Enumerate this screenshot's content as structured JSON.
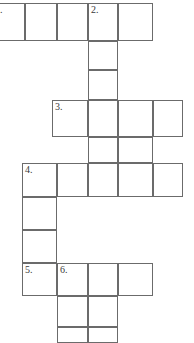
{
  "puzzle": {
    "kind": "crossword-grid",
    "title": "",
    "grid_width_px": 194,
    "grid_height_px": 341,
    "cell_border_color": "#6b6b6b",
    "cell_fill_color": "#ffffff",
    "number_color": "#3a3a3a",
    "column_edges_px": [
      -8,
      25,
      57,
      88,
      118,
      153,
      183
    ],
    "row_edges_px": [
      3,
      41,
      70,
      100,
      137,
      163,
      197,
      230,
      263,
      296,
      327,
      341
    ],
    "clue_numbers_visible": [
      "1.",
      "2.",
      "3.",
      "4.",
      "5.",
      "6."
    ],
    "cells": [
      {
        "name": "r1c1",
        "x": -8,
        "y": 3,
        "w": 33,
        "h": 38,
        "number": "1.",
        "letter": ""
      },
      {
        "name": "r1c2",
        "x": 25,
        "y": 3,
        "w": 32,
        "h": 38,
        "number": "",
        "letter": ""
      },
      {
        "name": "r1c3",
        "x": 57,
        "y": 3,
        "w": 31,
        "h": 38,
        "number": "",
        "letter": ""
      },
      {
        "name": "r1c4",
        "x": 88,
        "y": 3,
        "w": 30,
        "h": 38,
        "number": "2.",
        "letter": ""
      },
      {
        "name": "r1c5",
        "x": 118,
        "y": 3,
        "w": 35,
        "h": 38,
        "number": "",
        "letter": ""
      },
      {
        "name": "r2c4",
        "x": 88,
        "y": 41,
        "w": 30,
        "h": 29,
        "number": "",
        "letter": ""
      },
      {
        "name": "r3c4",
        "x": 88,
        "y": 70,
        "w": 30,
        "h": 30,
        "number": "",
        "letter": ""
      },
      {
        "name": "r4c3",
        "x": 52,
        "y": 100,
        "w": 36,
        "h": 37,
        "number": "3.",
        "letter": ""
      },
      {
        "name": "r4c4",
        "x": 88,
        "y": 100,
        "w": 30,
        "h": 37,
        "number": "",
        "letter": ""
      },
      {
        "name": "r4c5",
        "x": 118,
        "y": 100,
        "w": 35,
        "h": 37,
        "number": "",
        "letter": ""
      },
      {
        "name": "r4c6",
        "x": 153,
        "y": 100,
        "w": 30,
        "h": 37,
        "number": "",
        "letter": ""
      },
      {
        "name": "r5c4",
        "x": 88,
        "y": 137,
        "w": 30,
        "h": 26,
        "number": "",
        "letter": ""
      },
      {
        "name": "r5c5",
        "x": 118,
        "y": 137,
        "w": 35,
        "h": 26,
        "number": "",
        "letter": ""
      },
      {
        "name": "r6c2",
        "x": 22,
        "y": 163,
        "w": 35,
        "h": 34,
        "number": "4.",
        "letter": ""
      },
      {
        "name": "r6c3",
        "x": 57,
        "y": 163,
        "w": 31,
        "h": 34,
        "number": "",
        "letter": ""
      },
      {
        "name": "r6c4",
        "x": 88,
        "y": 163,
        "w": 30,
        "h": 34,
        "number": "",
        "letter": ""
      },
      {
        "name": "r6c5",
        "x": 118,
        "y": 163,
        "w": 35,
        "h": 34,
        "number": "",
        "letter": ""
      },
      {
        "name": "r6c6",
        "x": 153,
        "y": 163,
        "w": 30,
        "h": 34,
        "number": "",
        "letter": ""
      },
      {
        "name": "r7c2",
        "x": 22,
        "y": 197,
        "w": 35,
        "h": 33,
        "number": "",
        "letter": ""
      },
      {
        "name": "r8c2",
        "x": 22,
        "y": 230,
        "w": 35,
        "h": 33,
        "number": "",
        "letter": ""
      },
      {
        "name": "r9c2",
        "x": 22,
        "y": 263,
        "w": 35,
        "h": 33,
        "number": "5.",
        "letter": ""
      },
      {
        "name": "r9c3",
        "x": 57,
        "y": 263,
        "w": 31,
        "h": 33,
        "number": "6.",
        "letter": ""
      },
      {
        "name": "r9c4",
        "x": 88,
        "y": 263,
        "w": 30,
        "h": 33,
        "number": "",
        "letter": ""
      },
      {
        "name": "r9c5",
        "x": 118,
        "y": 263,
        "w": 35,
        "h": 33,
        "number": "",
        "letter": ""
      },
      {
        "name": "r10c3",
        "x": 57,
        "y": 296,
        "w": 31,
        "h": 31,
        "number": "",
        "letter": ""
      },
      {
        "name": "r10c4",
        "x": 88,
        "y": 296,
        "w": 30,
        "h": 31,
        "number": "",
        "letter": ""
      },
      {
        "name": "r11c3",
        "x": 57,
        "y": 327,
        "w": 31,
        "h": 16,
        "number": "",
        "letter": ""
      },
      {
        "name": "r11c4",
        "x": 88,
        "y": 327,
        "w": 30,
        "h": 16,
        "number": "",
        "letter": ""
      }
    ]
  }
}
